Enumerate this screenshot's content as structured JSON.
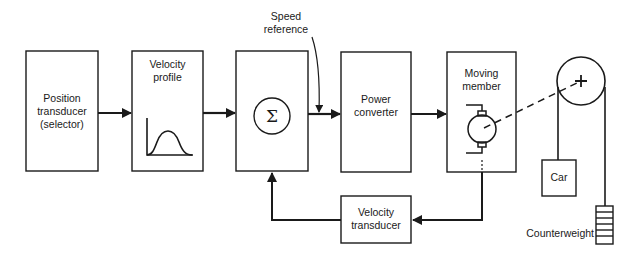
{
  "diagram": {
    "blocks": [
      {
        "id": "position_transducer",
        "label_lines": [
          "Position",
          "transducer",
          "(selector)"
        ]
      },
      {
        "id": "velocity_profile",
        "label_lines": [
          "Velocity",
          "profile"
        ]
      },
      {
        "id": "summing_junction",
        "symbol": "Σ"
      },
      {
        "id": "power_converter",
        "label_lines": [
          "Power",
          "converter"
        ]
      },
      {
        "id": "moving_member",
        "label_lines": [
          "Moving",
          "member"
        ]
      },
      {
        "id": "velocity_transducer",
        "label_lines": [
          "Velocity",
          "transducer"
        ]
      },
      {
        "id": "car",
        "label": "Car"
      }
    ],
    "annotations": {
      "speed_reference": [
        "Speed",
        "reference"
      ],
      "counterweight": "Counterweight"
    },
    "connections": [
      {
        "from": "position_transducer",
        "to": "velocity_profile"
      },
      {
        "from": "velocity_profile",
        "to": "summing_junction"
      },
      {
        "from": "summing_junction",
        "to": "power_converter",
        "note": "speed reference tapped here"
      },
      {
        "from": "power_converter",
        "to": "moving_member"
      },
      {
        "from": "moving_member",
        "to": "velocity_transducer",
        "type": "feedback"
      },
      {
        "from": "velocity_transducer",
        "to": "summing_junction",
        "type": "feedback"
      },
      {
        "from": "moving_member",
        "to": "pulley",
        "type": "mechanical-dashed"
      },
      {
        "from": "pulley",
        "to": "car",
        "type": "rope"
      },
      {
        "from": "pulley",
        "to": "counterweight",
        "type": "rope"
      }
    ],
    "colors": {
      "line": "#1a1a1a",
      "background": "#ffffff"
    }
  }
}
